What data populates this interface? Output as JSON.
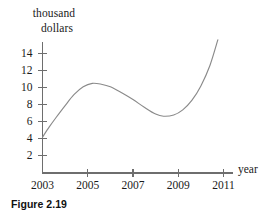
{
  "figure": {
    "caption": "Figure 2.19"
  },
  "chart_data": {
    "type": "line",
    "title": "",
    "subtitle": "",
    "xlabel": "year",
    "ylabel": "thousand dollars",
    "ylabel_lines": [
      "thousand",
      "dollars"
    ],
    "xlim": [
      2003,
      2011.6
    ],
    "ylim": [
      0,
      15.8
    ],
    "grid": false,
    "legend": null,
    "xticks": [
      2003,
      2005,
      2007,
      2009,
      2011
    ],
    "xtick_labels": [
      "2003",
      "2005",
      "2007",
      "2009",
      "2011"
    ],
    "yticks": [
      2,
      4,
      6,
      8,
      10,
      12,
      14
    ],
    "ytick_labels": [
      "2",
      "4",
      "6",
      "8",
      "10",
      "12",
      "14"
    ],
    "series": [
      {
        "name": "value",
        "color": "#8a8a8a",
        "x": [
          2003.0,
          2003.3,
          2003.6,
          2004.0,
          2004.4,
          2004.8,
          2005.2,
          2005.6,
          2006.0,
          2006.5,
          2007.0,
          2007.5,
          2008.0,
          2008.35,
          2008.8,
          2009.2,
          2009.6,
          2010.0,
          2010.4,
          2010.75
        ],
        "values": [
          4.2,
          5.4,
          6.5,
          7.9,
          9.2,
          10.1,
          10.5,
          10.4,
          10.1,
          9.4,
          8.6,
          7.7,
          6.9,
          6.65,
          6.8,
          7.4,
          8.5,
          10.2,
          12.6,
          15.6
        ]
      }
    ],
    "annotations": {
      "local_max": {
        "x": 2005.2,
        "y": 10.5
      },
      "local_min": {
        "x": 2008.35,
        "y": 6.65
      },
      "start": {
        "x": 2003.0,
        "y": 4.2
      },
      "end": {
        "x": 2010.75,
        "y": 15.6
      }
    }
  },
  "axes": {
    "x_axis_label": "year",
    "y_axis_label_line1": "thousand",
    "y_axis_label_line2": "dollars"
  }
}
